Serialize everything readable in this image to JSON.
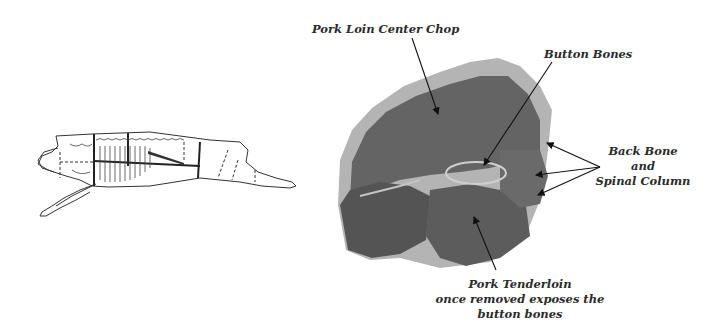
{
  "diagram": {
    "labels": {
      "pork_loin_center_chop": "Pork Loin Center Chop",
      "button_bones": "Button Bones",
      "back_bone_line1": "Back Bone",
      "back_bone_line2": "and",
      "back_bone_line3": "Spinal Column",
      "tenderloin_line1": "Pork Tenderloin",
      "tenderloin_line2": "once removed exposes the",
      "tenderloin_line3": "button bones"
    },
    "figures": {
      "pig_skeleton": "pig-carcass-skeleton-diagram",
      "chop_photo": "pork-loin-center-chop-photo"
    },
    "colors": {
      "meat": "#5e5e5e",
      "meat_dark": "#4a4a4a",
      "fat": "#b8b8b8",
      "text": "#2b2b2b",
      "ellipse": "#c9c9c9"
    }
  }
}
